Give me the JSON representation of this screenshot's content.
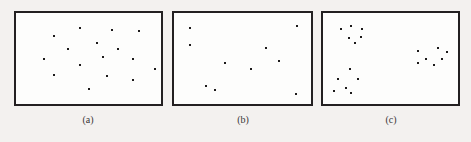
{
  "figure": {
    "background_color": "#f3f1ef",
    "panel_fill_color": "#fdfdfc",
    "border_color": "#232021",
    "point_color": "#1d1a1b",
    "label_color": "#3a3637",
    "width": 471,
    "height": 142
  },
  "panels": [
    {
      "id": "a",
      "label": "(a)",
      "box": {
        "x": 14,
        "y": 11,
        "width": 149,
        "height": 95
      },
      "label_position": {
        "x": 88,
        "y": 114
      }
    },
    {
      "id": "b",
      "label": "(b)",
      "box": {
        "x": 172,
        "y": 11,
        "width": 141,
        "height": 95
      },
      "label_position": {
        "x": 243,
        "y": 114
      }
    },
    {
      "id": "c",
      "label": "(c)",
      "box": {
        "x": 321,
        "y": 11,
        "width": 139,
        "height": 95
      },
      "label_position": {
        "x": 391,
        "y": 114
      }
    }
  ],
  "chart_data": {
    "type": "scatter",
    "title": "",
    "xlabel": "",
    "ylabel": "",
    "grid": false,
    "legend": "none",
    "axis_ticks": "none",
    "xlim": [
      0,
      100
    ],
    "ylim": [
      0,
      100
    ],
    "marker": "square",
    "marker_size_px": 2,
    "panels": [
      {
        "id": "a",
        "label": "(a)",
        "point_count": 16,
        "points": [
          {
            "x": 26.0,
            "y": 25.0
          },
          {
            "x": 44.0,
            "y": 17.0
          },
          {
            "x": 66.0,
            "y": 19.0
          },
          {
            "x": 85.0,
            "y": 20.0
          },
          {
            "x": 56.0,
            "y": 33.0
          },
          {
            "x": 36.0,
            "y": 40.0
          },
          {
            "x": 19.0,
            "y": 50.0
          },
          {
            "x": 60.0,
            "y": 48.0
          },
          {
            "x": 81.0,
            "y": 50.0
          },
          {
            "x": 44.0,
            "y": 57.0
          },
          {
            "x": 26.0,
            "y": 68.0
          },
          {
            "x": 63.0,
            "y": 69.0
          },
          {
            "x": 96.0,
            "y": 62.0
          },
          {
            "x": 81.0,
            "y": 74.0
          },
          {
            "x": 50.0,
            "y": 84.0
          },
          {
            "x": 70.0,
            "y": 40.0
          }
        ]
      },
      {
        "id": "b",
        "label": "(b)",
        "point_count": 10,
        "points": [
          {
            "x": 12.0,
            "y": 17.0
          },
          {
            "x": 90.0,
            "y": 14.0
          },
          {
            "x": 12.0,
            "y": 35.0
          },
          {
            "x": 67.0,
            "y": 38.0
          },
          {
            "x": 77.0,
            "y": 53.0
          },
          {
            "x": 37.0,
            "y": 55.0
          },
          {
            "x": 56.0,
            "y": 62.0
          },
          {
            "x": 23.0,
            "y": 80.0
          },
          {
            "x": 30.0,
            "y": 85.0
          },
          {
            "x": 89.0,
            "y": 89.0
          }
        ]
      },
      {
        "id": "c",
        "label": "(c)",
        "point_count": 19,
        "cluster_count": 3,
        "clusters": [
          {
            "name": "cluster-top-left",
            "points": [
              {
                "x": 13.0,
                "y": 18.0
              },
              {
                "x": 21.0,
                "y": 14.0
              },
              {
                "x": 29.0,
                "y": 18.0
              },
              {
                "x": 19.0,
                "y": 27.0
              },
              {
                "x": 28.0,
                "y": 26.0
              },
              {
                "x": 24.0,
                "y": 33.0
              }
            ]
          },
          {
            "name": "cluster-right",
            "points": [
              {
                "x": 70.0,
                "y": 42.0
              },
              {
                "x": 85.0,
                "y": 38.0
              },
              {
                "x": 92.0,
                "y": 43.0
              },
              {
                "x": 76.0,
                "y": 50.0
              },
              {
                "x": 88.0,
                "y": 50.0
              },
              {
                "x": 70.0,
                "y": 55.0
              },
              {
                "x": 82.0,
                "y": 57.0
              }
            ]
          },
          {
            "name": "cluster-bottom-left",
            "points": [
              {
                "x": 20.0,
                "y": 62.0
              },
              {
                "x": 11.0,
                "y": 72.0
              },
              {
                "x": 26.0,
                "y": 73.0
              },
              {
                "x": 17.0,
                "y": 82.0
              },
              {
                "x": 8.0,
                "y": 86.0
              },
              {
                "x": 21.0,
                "y": 88.0
              }
            ]
          }
        ]
      }
    ]
  }
}
